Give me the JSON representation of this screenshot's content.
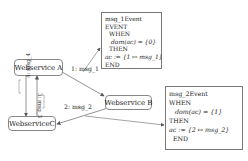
{
  "nodes": {
    "webservice_a": "Webservice A",
    "webservice_b": "Webservice B",
    "webservice_c": "WebserviceC"
  },
  "edges": {
    "a_to_b": "1: msg_1",
    "b_to_c": "2: msg_2",
    "a_to_c": "4: msg_4",
    "c_to_a": "3: msg_3"
  },
  "event1": {
    "lines": [
      "msg_1Event",
      "EVENT",
      "WHEN",
      "dom(ac) = {0}",
      "THEN",
      "ac := {1 ↦ msg_1}",
      "END"
    ]
  },
  "event2": {
    "lines": [
      "msg_2Event",
      "WHEN",
      "dom(ac) = {1}",
      "THEN",
      "ac := {2 ↦ msg_2}",
      "END"
    ]
  },
  "colors": {
    "line": "#555555",
    "border": "#888888",
    "background": "#ffffff"
  }
}
